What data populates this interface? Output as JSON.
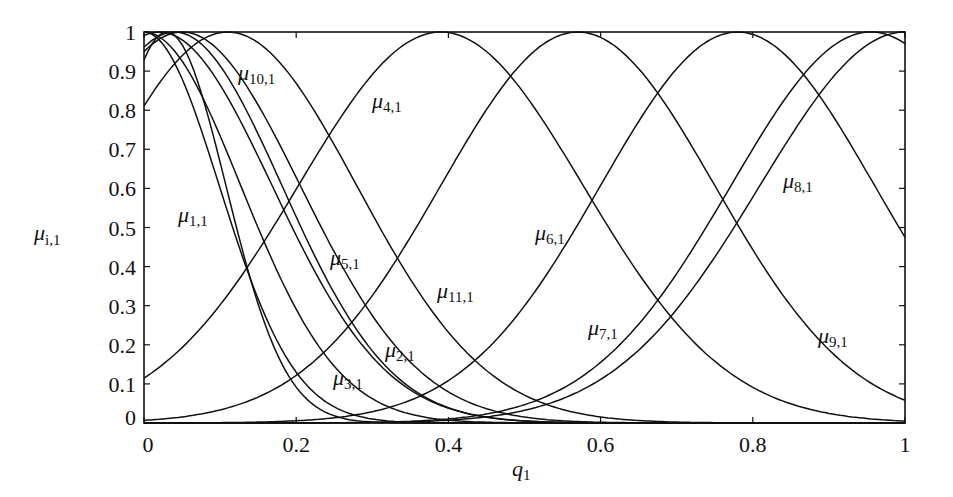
{
  "chart_data": {
    "type": "line",
    "title": "",
    "xlabel": "q1",
    "ylabel": "μi,1",
    "xlim": [
      0,
      1
    ],
    "ylim": [
      0,
      1
    ],
    "grid": false,
    "legend": "inline labels",
    "x_ticks": [
      "0",
      "0.2",
      "0.4",
      "0.6",
      "0.8",
      "1"
    ],
    "y_ticks": [
      "0",
      "0.1",
      "0.2",
      "0.3",
      "0.4",
      "0.5",
      "0.6",
      "0.7",
      "0.8",
      "0.9",
      "1"
    ],
    "curve_model": "gaussian exp(-((q-c)/sigma)^2)",
    "series": [
      {
        "name": "μ1,1",
        "c": 0.0,
        "sigma": 0.14,
        "label_pos": [
          178,
          222
        ]
      },
      {
        "name": "μ2,1",
        "c": 0.02,
        "sigma": 0.21,
        "label_pos": [
          385,
          357
        ]
      },
      {
        "name": "μ3,1",
        "c": 0.0,
        "sigma": 0.18,
        "label_pos": [
          333,
          385
        ]
      },
      {
        "name": "μ4,1",
        "c": 0.39,
        "sigma": 0.265,
        "label_pos": [
          372,
          108
        ]
      },
      {
        "name": "μ5,1",
        "c": 0.04,
        "sigma": 0.2,
        "label_pos": [
          330,
          265
        ]
      },
      {
        "name": "μ6,1",
        "c": 0.57,
        "sigma": 0.255,
        "label_pos": [
          535,
          240
        ]
      },
      {
        "name": "μ7,1",
        "c": 0.955,
        "sigma": 0.26,
        "label_pos": [
          588,
          335
        ]
      },
      {
        "name": "μ8,1",
        "c": 1.0,
        "sigma": 0.27,
        "label_pos": [
          783,
          188
        ]
      },
      {
        "name": "μ9,1",
        "c": 0.78,
        "sigma": 0.255,
        "label_pos": [
          818,
          343
        ]
      },
      {
        "name": "μ10,1",
        "c": 0.11,
        "sigma": 0.24,
        "label_pos": [
          238,
          80
        ]
      },
      {
        "name": "μ11,1",
        "c": 0.05,
        "sigma": 0.22,
        "label_pos": [
          437,
          298
        ]
      },
      {
        "name": "μ12,1",
        "c": 0.03,
        "sigma": 0.11,
        "label_pos": null
      }
    ],
    "x": [
      0,
      0.1,
      0.2,
      0.3,
      0.4,
      0.5,
      0.6,
      0.7,
      0.8,
      0.9,
      1.0
    ],
    "sampled_values": {
      "μ1,1": [
        1.0,
        0.6,
        0.13,
        0.01,
        0.0,
        0.0,
        0.0,
        0.0,
        0.0,
        0.0,
        0.0
      ],
      "μ4,1": [
        0.11,
        0.3,
        0.6,
        0.89,
        1.0,
        0.84,
        0.53,
        0.25,
        0.09,
        0.02,
        0.0
      ],
      "μ6,1": [
        0.01,
        0.03,
        0.1,
        0.26,
        0.53,
        0.93,
        0.99,
        0.73,
        0.4,
        0.16,
        0.05
      ],
      "μ9,1": [
        0.0,
        0.0,
        0.01,
        0.03,
        0.11,
        0.3,
        0.61,
        0.9,
        0.99,
        0.8,
        0.47
      ],
      "μ7,1": [
        0.0,
        0.0,
        0.0,
        0.0,
        0.01,
        0.05,
        0.15,
        0.35,
        0.7,
        0.96,
        0.97
      ],
      "μ8,1": [
        0.0,
        0.0,
        0.0,
        0.0,
        0.01,
        0.03,
        0.11,
        0.29,
        0.56,
        0.87,
        1.0
      ],
      "μ10,1": [
        0.81,
        1.0,
        0.85,
        0.5,
        0.21,
        0.06,
        0.01,
        0.0,
        0.0,
        0.0,
        0.0
      ]
    }
  },
  "axes": {
    "xlabel_main": "q",
    "xlabel_sub": "1",
    "ylabel_main": "μ",
    "ylabel_sub": "i,1"
  },
  "style": {
    "line_color": "#111111",
    "background": "#ffffff"
  }
}
